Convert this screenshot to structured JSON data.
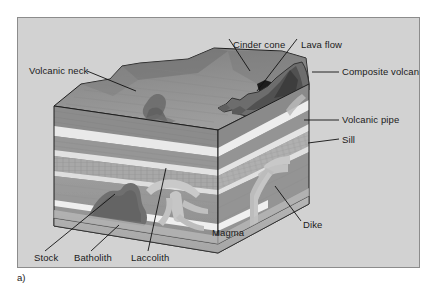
{
  "figure": {
    "caption": "a)",
    "panel_bg": "#d2d2d2",
    "border_color": "#8c8c8c",
    "labels": [
      {
        "id": "cinder-cone",
        "text": "Cinder cone",
        "x": 215,
        "y": 26
      },
      {
        "id": "lava-flow",
        "text": "Lava flow",
        "x": 290,
        "y": 26
      },
      {
        "id": "volcanic-neck",
        "text": "Volcanic neck",
        "x": 28,
        "y": 66
      },
      {
        "id": "composite-volcano",
        "text": "Composite volcano",
        "x": 338,
        "y": 71
      },
      {
        "id": "volcanic-pipe",
        "text": "Volcanic pipe",
        "x": 338,
        "y": 119
      },
      {
        "id": "sill",
        "text": "Sill",
        "x": 338,
        "y": 139
      },
      {
        "id": "dike",
        "text": "Dike",
        "x": 299,
        "y": 223
      },
      {
        "id": "magma",
        "text": "Magma",
        "x": 207,
        "y": 231
      },
      {
        "id": "stock",
        "text": "Stock",
        "x": 33,
        "y": 255
      },
      {
        "id": "batholith",
        "text": "Batholith",
        "x": 76,
        "y": 255
      },
      {
        "id": "laccolith",
        "text": "Laccolith",
        "x": 132,
        "y": 255
      }
    ],
    "leaders": [
      {
        "id": "leader-cinder-cone",
        "x1": 226,
        "y1": 38,
        "x2": 246,
        "y2": 69
      },
      {
        "id": "leader-lava-flow",
        "x1": 294,
        "y1": 38,
        "x2": 254,
        "y2": 90
      },
      {
        "id": "leader-volcanic-neck",
        "x1": 84,
        "y1": 70,
        "x2": 133,
        "y2": 90
      },
      {
        "id": "leader-composite-volcano",
        "x1": 336,
        "y1": 71,
        "x2": 309,
        "y2": 71
      },
      {
        "id": "leader-volcanic-pipe",
        "x1": 336,
        "y1": 119,
        "x2": 301,
        "y2": 119
      },
      {
        "id": "leader-sill",
        "x1": 336,
        "y1": 138,
        "x2": 305,
        "y2": 142
      },
      {
        "id": "leader-dike",
        "x1": 298,
        "y1": 220,
        "x2": 272,
        "y2": 185
      },
      {
        "id": "leader-stock",
        "x1": 42,
        "y1": 250,
        "x2": 112,
        "y2": 193
      },
      {
        "id": "leader-batholith",
        "x1": 88,
        "y1": 250,
        "x2": 116,
        "y2": 224
      },
      {
        "id": "leader-laccolith",
        "x1": 145,
        "y1": 250,
        "x2": 163,
        "y2": 167
      }
    ],
    "geology": {
      "type": "block-diagram",
      "subject": "Volcanic and plutonic igneous features",
      "features": [
        "Cinder cone",
        "Lava flow",
        "Volcanic neck",
        "Composite volcano",
        "Volcanic pipe",
        "Sill",
        "Dike",
        "Magma",
        "Stock",
        "Batholith",
        "Laccolith"
      ],
      "strata_colors": {
        "surface": "#8e8e8e",
        "surface_dark": "#6e6e6e",
        "layer_mid": "#8a8a8a",
        "layer_light": "#e8e8e8",
        "layer_band": "#b4b4b4",
        "deep_rock": "#9a9a9a",
        "magma_body": "#7a7a7a",
        "intrusion_light": "#c4c4c4",
        "front_face": "#b0b0b0",
        "lava_dark": "#2a2a2a"
      }
    }
  }
}
